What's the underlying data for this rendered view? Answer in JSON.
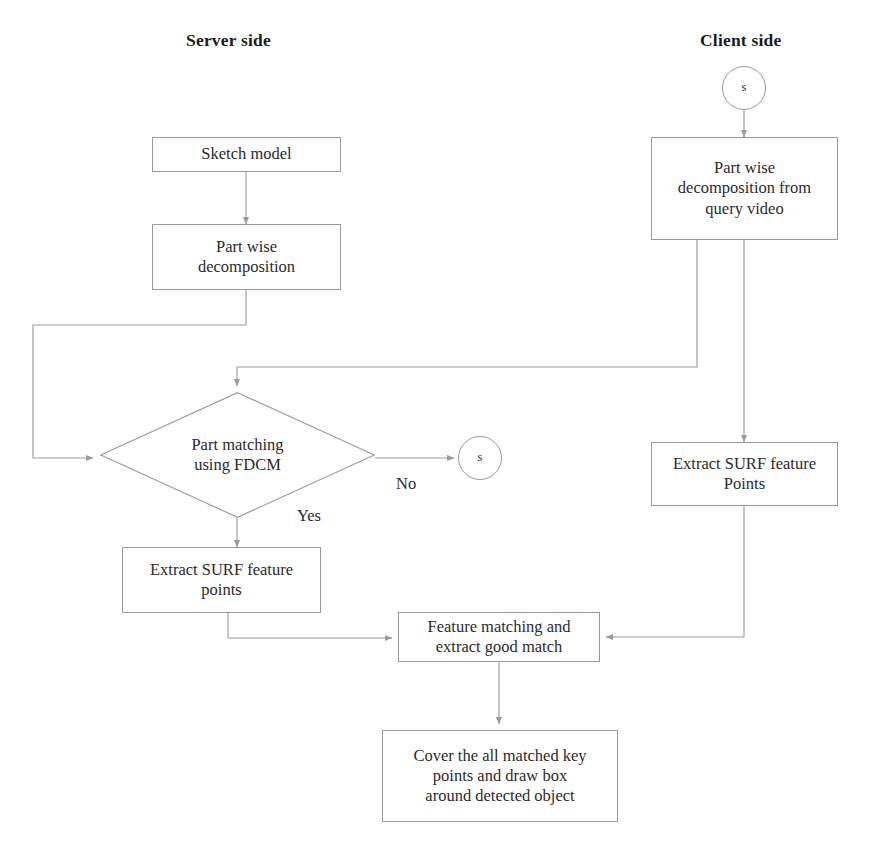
{
  "diagram": {
    "title_server": "Server side",
    "title_client": "Client side",
    "nodes": {
      "sketch_model": "Sketch model",
      "part_wise_decomposition": "Part wise\ndecomposition",
      "client_start": "s",
      "part_wise_decomposition_query": "Part wise\ndecomposition from\nquery video",
      "part_matching": "Part matching\nusing FDCM",
      "no_terminal": "s",
      "extract_surf_server": "Extract SURF feature\npoints",
      "extract_surf_client": "Extract SURF feature\nPoints",
      "feature_matching": "Feature matching and\nextract good match",
      "cover_matched": "Cover the all matched key\npoints and draw box\naround detected object"
    },
    "edge_labels": {
      "no": "No",
      "yes": "Yes"
    },
    "colors": {
      "stroke": "#9a9a9a",
      "text": "#2b2b2b",
      "background": "#ffffff"
    }
  }
}
